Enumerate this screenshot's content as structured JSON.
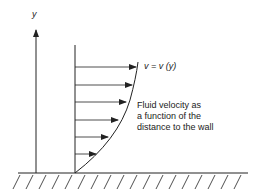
{
  "diagram": {
    "axis_label": "y",
    "velocity_label": "v = v (y)",
    "description_lines": [
      "Fluid velocity as",
      "a function of the",
      "distance to the wall"
    ],
    "arrow_y_positions": [
      67,
      85,
      102,
      120,
      137,
      154
    ],
    "arrow_tip_x": [
      136,
      132,
      125,
      116,
      106,
      95
    ],
    "colors": {
      "stroke": "#222222",
      "background": "#ffffff"
    }
  }
}
